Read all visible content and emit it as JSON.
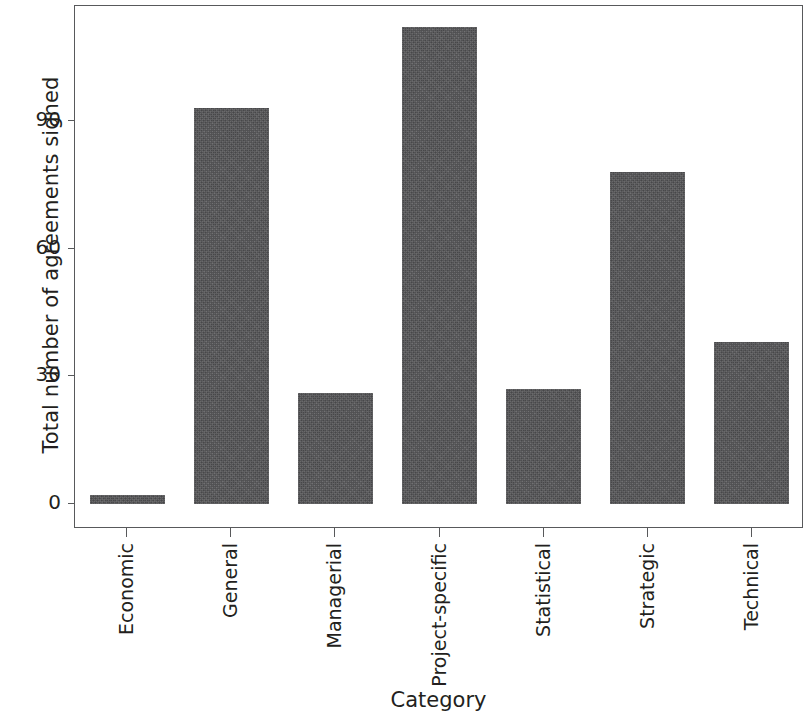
{
  "chart_data": {
    "type": "bar",
    "title": "",
    "xlabel": "Category",
    "ylabel": "Total number of agreements signed",
    "categories": [
      "Economic",
      "General",
      "Managerial",
      "Project-specific",
      "Statistical",
      "Strategic",
      "Technical"
    ],
    "values": [
      2,
      93,
      26,
      112,
      27,
      78,
      38
    ],
    "ylim": [
      0,
      117
    ],
    "yticks": [
      0,
      30,
      60,
      90
    ],
    "ytick_labels": [
      "0",
      "30",
      "60",
      "90"
    ],
    "grid": false,
    "legend": null,
    "bar_color": "#555557",
    "axis_color": "#58595b",
    "text_color": "#231f20",
    "background": "#ffffff",
    "tick_label_rotation": 90
  }
}
